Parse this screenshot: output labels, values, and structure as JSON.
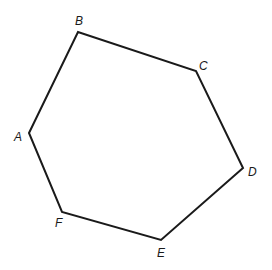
{
  "diagram": {
    "type": "hexagon",
    "stroke_color": "#1a1a1a",
    "vertices": [
      {
        "name": "A",
        "x": 29,
        "y": 133,
        "label_x": 14,
        "label_y": 141
      },
      {
        "name": "B",
        "x": 78,
        "y": 32,
        "label_x": 75,
        "label_y": 25
      },
      {
        "name": "C",
        "x": 196,
        "y": 71,
        "label_x": 199,
        "label_y": 70
      },
      {
        "name": "D",
        "x": 243,
        "y": 168,
        "label_x": 248,
        "label_y": 176
      },
      {
        "name": "E",
        "x": 161,
        "y": 240,
        "label_x": 157,
        "label_y": 257
      },
      {
        "name": "F",
        "x": 62,
        "y": 212,
        "label_x": 55,
        "label_y": 227
      }
    ],
    "labels": [
      "A",
      "B",
      "C",
      "D",
      "E",
      "F"
    ]
  }
}
